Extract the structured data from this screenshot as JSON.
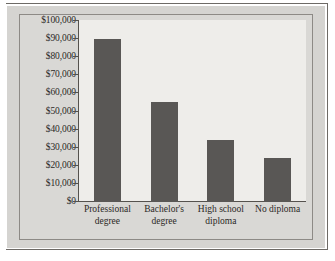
{
  "figure": {
    "kind": "bar-chart-figure",
    "panel_color": "#d5d4d1",
    "plot_background": "#eeedea",
    "bar_color": "#595755",
    "axis_color": "#55524e",
    "rule_color": "#6d6a66",
    "text_color": "#2b2926"
  },
  "chart_data": {
    "type": "bar",
    "title": "",
    "xlabel": "",
    "ylabel": "",
    "categories": [
      "Professional degree",
      "Bachelor's degree",
      "High school diploma",
      "No diploma"
    ],
    "category_lines": [
      [
        "Professional",
        "degree"
      ],
      [
        "Bachelor's",
        "degree"
      ],
      [
        "High school",
        "diploma"
      ],
      [
        "No diploma",
        ""
      ]
    ],
    "values": [
      90000,
      55500,
      34000,
      24500
    ],
    "value_labels": [
      "$90,000",
      "$55,500",
      "$34,000",
      "$24,500"
    ],
    "ylim": [
      0,
      100000
    ],
    "ytick_values": [
      0,
      10000,
      20000,
      30000,
      40000,
      50000,
      60000,
      70000,
      80000,
      90000,
      100000
    ],
    "ytick_labels": [
      "$100,000",
      "$90,000",
      "$80,000",
      "$70,000",
      "$60,000",
      "$50,000",
      "$40,000",
      "$30,000",
      "$20,000",
      "$10,000",
      "$0"
    ],
    "grid": false,
    "legend": null,
    "legend_position": "none",
    "orientation": "vertical"
  }
}
